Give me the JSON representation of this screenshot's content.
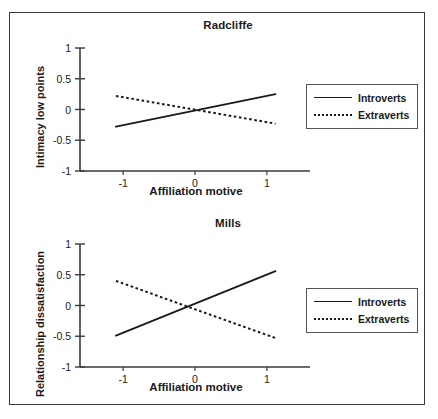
{
  "figure": {
    "panels": [
      "Radcliffe",
      "Mills"
    ]
  },
  "chart_data": [
    {
      "type": "line",
      "title": "Radcliffe",
      "xlabel": "Affiliation motive",
      "ylabel": "Intimacy low points",
      "xlim": [
        -1.6,
        1.6
      ],
      "ylim": [
        -1,
        1
      ],
      "xticks": [
        -1,
        0,
        1
      ],
      "xticklabels": [
        "-1",
        "0",
        "1"
      ],
      "yticks": [
        1,
        0.5,
        0,
        -0.5,
        -1
      ],
      "yticklabels": [
        "1",
        "0.5",
        "0",
        "-0.5",
        "-1"
      ],
      "grid": false,
      "legend_position": "right",
      "x": [
        -1.1,
        1.12
      ],
      "series": [
        {
          "name": "Introverts",
          "style": "solid",
          "values": [
            -0.28,
            0.25
          ]
        },
        {
          "name": "Extraverts",
          "style": "dotted",
          "values": [
            0.22,
            -0.23
          ]
        }
      ]
    },
    {
      "type": "line",
      "title": "Mills",
      "xlabel": "Affiliation motive",
      "ylabel": "Relationship dissatisfaction",
      "xlim": [
        -1.6,
        1.6
      ],
      "ylim": [
        -1,
        1
      ],
      "xticks": [
        -1,
        0,
        1
      ],
      "xticklabels": [
        "-1",
        "0",
        "1"
      ],
      "yticks": [
        1,
        0.5,
        0,
        -0.5,
        -1
      ],
      "yticklabels": [
        "1",
        "0.5",
        "0",
        "-0.5",
        "-1"
      ],
      "grid": false,
      "legend_position": "right",
      "x": [
        -1.1,
        1.12
      ],
      "series": [
        {
          "name": "Introverts",
          "style": "solid",
          "values": [
            -0.49,
            0.56
          ]
        },
        {
          "name": "Extraverts",
          "style": "dotted",
          "values": [
            0.4,
            -0.53
          ]
        }
      ]
    }
  ],
  "colors": {
    "line": "#1a1a1a",
    "axis": "#3a3a3a",
    "border": "#3a3a3a",
    "background": "#ffffff"
  }
}
